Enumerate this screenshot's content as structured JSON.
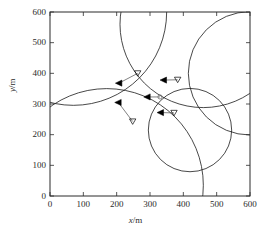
{
  "chart_data": {
    "type": "scatter",
    "title": "",
    "xlabel": "x/m",
    "ylabel": "y/m",
    "xlim": [
      0,
      600
    ],
    "ylim": [
      0,
      600
    ],
    "xticks": [
      0,
      100,
      200,
      300,
      400,
      500,
      600
    ],
    "yticks": [
      0,
      100,
      200,
      300,
      400,
      500,
      600
    ],
    "grid": false,
    "legend": "none",
    "xtick_labels": [
      "0",
      "100",
      "200",
      "300",
      "400",
      "500",
      "600"
    ],
    "ytick_labels": [
      "0",
      "100",
      "200",
      "300",
      "400",
      "500",
      "600"
    ],
    "series": [
      {
        "name": "coverage circles",
        "type": "circle",
        "stroke": "#1a1a1a",
        "items": [
          {
            "cx": 70,
            "cy": 600,
            "r": 280
          },
          {
            "cx": 460,
            "cy": 560,
            "r": 250
          },
          {
            "cx": 170,
            "cy": 35,
            "r": 290
          },
          {
            "cx": 420,
            "cy": 215,
            "r": 125
          },
          {
            "cx": 600,
            "cy": 400,
            "r": 185
          }
        ]
      },
      {
        "name": "agents",
        "type": "marker",
        "marker": "filled-left-triangle",
        "color": "#000000",
        "points": [
          {
            "x": 207,
            "y": 368
          },
          {
            "x": 341,
            "y": 378
          },
          {
            "x": 292,
            "y": 323
          },
          {
            "x": 205,
            "y": 305
          },
          {
            "x": 332,
            "y": 272
          }
        ]
      },
      {
        "name": "targets",
        "type": "marker",
        "marker": "hollow-down-triangle",
        "color": "#000000",
        "points": [
          {
            "x": 263,
            "y": 400
          },
          {
            "x": 383,
            "y": 379
          },
          {
            "x": 248,
            "y": 243
          },
          {
            "x": 372,
            "y": 271
          }
        ]
      },
      {
        "name": "target-circle",
        "type": "marker",
        "marker": "hollow-circle",
        "color": "#6b6b6b",
        "points": [
          {
            "x": 330,
            "y": 323
          }
        ]
      },
      {
        "name": "connectors",
        "type": "segment",
        "color": "#4a4a4a",
        "segments": [
          {
            "x1": 207,
            "y1": 368,
            "x2": 263,
            "y2": 400
          },
          {
            "x1": 341,
            "y1": 378,
            "x2": 383,
            "y2": 379
          },
          {
            "x1": 292,
            "y1": 323,
            "x2": 330,
            "y2": 323
          },
          {
            "x1": 205,
            "y1": 305,
            "x2": 248,
            "y2": 243
          },
          {
            "x1": 332,
            "y1": 272,
            "x2": 372,
            "y2": 271
          }
        ]
      }
    ]
  },
  "axes": {
    "x_title_var": "x",
    "x_title_unit": "/m",
    "y_title_var": "y",
    "y_title_unit": "/m"
  }
}
